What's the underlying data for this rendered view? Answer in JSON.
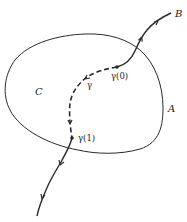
{
  "diagram": {
    "type": "topology-path-figure",
    "colors": {
      "stroke": "#2a2a2a",
      "background": "#ffffff"
    },
    "labels": {
      "region_A": "A",
      "region_C": "C",
      "point_B": "B",
      "path_gamma": "γ",
      "gamma_start": "γ(0)",
      "gamma_end": "γ(1)"
    },
    "elements": [
      {
        "name": "closed-curve-A",
        "style": "solid",
        "description": "closed curve bounding region"
      },
      {
        "name": "path-from-B",
        "style": "solid-arrowed",
        "description": "path from B entering region to γ(0)"
      },
      {
        "name": "path-gamma",
        "style": "dashed-arrowed",
        "description": "dashed path γ from γ(0) to γ(1)"
      },
      {
        "name": "path-exit",
        "style": "solid-arrowed",
        "description": "path leaving region from γ(1)"
      }
    ]
  }
}
